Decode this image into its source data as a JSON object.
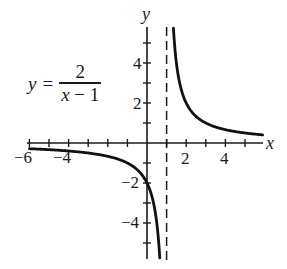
{
  "chart_data": {
    "type": "line",
    "title": "",
    "function": "y = 2/(x - 1)",
    "equation_label": {
      "lhs": "y",
      "equals": "=",
      "numerator": "2",
      "denominator_var": "x",
      "denominator_rest": " − 1"
    },
    "xlabel": "x",
    "ylabel": "y",
    "xlim": [
      -6.2,
      5.9
    ],
    "ylim": [
      -5.8,
      5.8
    ],
    "x_ticks": [
      -6,
      -5,
      -4,
      -3,
      -2,
      -1,
      1,
      2,
      3,
      4,
      5
    ],
    "x_tick_labels": {
      "-6": "−6",
      "-4": "−4",
      "2": "2",
      "4": "4"
    },
    "y_ticks": [
      -5,
      -4,
      -3,
      -2,
      -1,
      1,
      2,
      3,
      4,
      5
    ],
    "y_tick_labels": {
      "4": "4",
      "2": "2",
      "-2": "−2",
      "-4": "−4"
    },
    "asymptotes": {
      "vertical": 1,
      "horizontal": 0,
      "style": "dashed"
    },
    "grid": false,
    "series": [
      {
        "name": "left branch",
        "x": [
          -6,
          -5,
          -4,
          -3,
          -2,
          -1,
          0,
          0.5,
          0.652
        ],
        "values": [
          -0.286,
          -0.333,
          -0.4,
          -0.5,
          -0.667,
          -1,
          -2,
          -4,
          -5.75
        ]
      },
      {
        "name": "right branch",
        "x": [
          1.348,
          1.5,
          2,
          3,
          4,
          5,
          5.9
        ],
        "values": [
          5.75,
          4,
          2,
          1,
          0.667,
          0.5,
          0.408
        ]
      }
    ]
  },
  "labels": {
    "x_axis": "x",
    "y_axis": "y",
    "x_tick_m6": "−6",
    "x_tick_m4": "−4",
    "x_tick_2": "2",
    "x_tick_4": "4",
    "y_tick_4": "4",
    "y_tick_2": "2",
    "y_tick_m2": "−2",
    "y_tick_m4": "−4"
  },
  "colors": {
    "ink": "#1a1a1a",
    "background": "#ffffff"
  }
}
